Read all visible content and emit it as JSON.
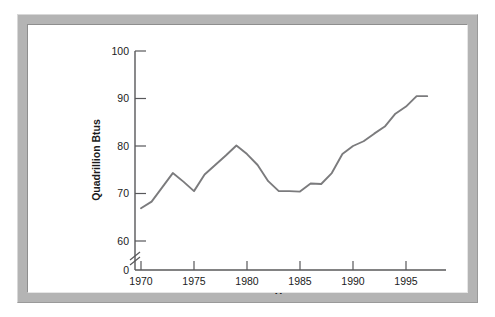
{
  "figure": {
    "frame_color": "#b4b4b4",
    "plot_background": "#ffffff",
    "line_color": "#7b7b7d",
    "axis_color": "#58585a"
  },
  "chart_data": {
    "type": "line",
    "title": "",
    "subtitle": "",
    "xlabel": "Year",
    "ylabel": "Quadrillion Btus",
    "xlim": [
      1969,
      1998
    ],
    "ylim": [
      55,
      100
    ],
    "grid": false,
    "legend": "none",
    "axis_break": {
      "present": true,
      "axis": "y",
      "between": [
        0,
        55
      ],
      "symbol": "double-slash"
    },
    "yticks": [
      0,
      60,
      70,
      80,
      90,
      100
    ],
    "ytick_labels": [
      "0",
      "60",
      "70",
      "80",
      "90",
      "100"
    ],
    "xticks": [
      1970,
      1975,
      1980,
      1985,
      1990,
      1995
    ],
    "xtick_labels": [
      "1970",
      "1975",
      "1980",
      "1985",
      "1990",
      "1995"
    ],
    "series": [
      {
        "name": "U.S. Energy Consumption",
        "x": [
          1970,
          1971,
          1972,
          1973,
          1974,
          1975,
          1976,
          1977,
          1978,
          1979,
          1980,
          1981,
          1982,
          1983,
          1984,
          1985,
          1986,
          1987,
          1988,
          1989,
          1990,
          1991,
          1992,
          1993,
          1994,
          1995,
          1996,
          1997
        ],
        "values": [
          66.9,
          68.3,
          71.3,
          74.3,
          72.5,
          70.5,
          74.0,
          76.0,
          78.0,
          80.1,
          78.3,
          76.0,
          72.6,
          70.5,
          70.5,
          70.4,
          72.1,
          72.0,
          74.3,
          78.3,
          80.0,
          81.0,
          82.6,
          84.1,
          86.8,
          88.3,
          90.5,
          90.5
        ]
      }
    ]
  }
}
